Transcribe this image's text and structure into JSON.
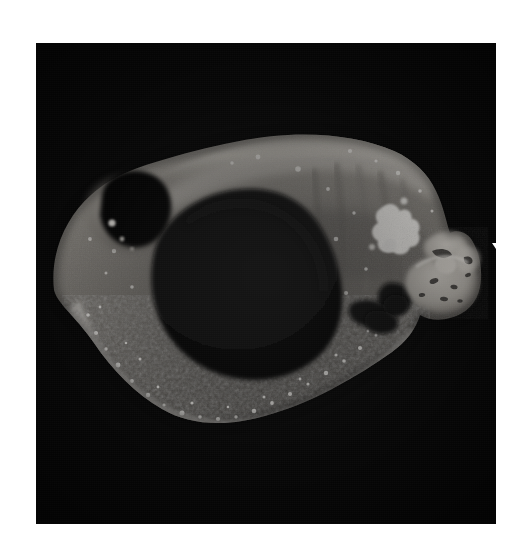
{
  "figure": {
    "domain": "natural-image",
    "kind": "gross-pathology-photograph",
    "caption": "",
    "background_color": "#ffffff",
    "plate_color": "#050505",
    "plate": {
      "x": 36,
      "y": 43,
      "width": 460,
      "height": 481
    },
    "grayscale": true
  },
  "annotations": {
    "arrow": {
      "name": "white-down-arrow",
      "color": "#ffffff",
      "direction": "down",
      "tip": {
        "x": 472,
        "y": 224
      },
      "tail": {
        "x": 472,
        "y": 170
      },
      "points_to": "pale lobulated mass at right of specimen"
    }
  },
  "specimen": {
    "orientation": "lateral, snout to the right",
    "regions": [
      {
        "name": "orbital-cavity",
        "tone": "dark",
        "note": "dark oval socket upper-left"
      },
      {
        "name": "central-cavity",
        "tone": "black",
        "note": "large dark cavity in mid-specimen"
      },
      {
        "name": "dorsal-calvarium",
        "tone": "light-gray",
        "note": "bright band across the top"
      },
      {
        "name": "ventral-granular-rim",
        "tone": "speckled-bright",
        "note": "granular bright rim along bottom"
      },
      {
        "name": "bright-focus",
        "tone": "white",
        "note": "bright irregular focus right of centre"
      },
      {
        "name": "lobulated-mass",
        "tone": "pale-gray",
        "note": "nodular mass at right, indicated by arrow"
      }
    ]
  },
  "tones": {
    "white": "#ffffff",
    "highlight": "#e6e4e0",
    "light": "#c9c6c0",
    "mid": "#8e8b86",
    "mid_dark": "#5a5754",
    "dark": "#2a2826",
    "black": "#050505"
  }
}
